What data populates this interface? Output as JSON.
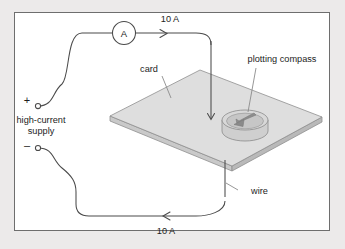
{
  "figure": {
    "kind": "physics-diagram",
    "background_color": "#eceaea",
    "panel_color": "#ffffff",
    "frame_color": "#6e6e6e",
    "wire_color": "#4a4a4a",
    "leader_color": "#8b8b8b",
    "card_top_color": "#dcdcdc",
    "card_edge_color": "#c2c2c2",
    "compass_color": "#d2d2d2",
    "needle_color": "#8a8a8a"
  },
  "cropped_caption": "",
  "labels": {
    "ammeter": "A",
    "current_top": "10 A",
    "current_bottom": "10 A",
    "plus_terminal": "+",
    "minus_terminal": "–",
    "supply_line1": "high-current",
    "supply_line2": "supply",
    "card": "card",
    "compass": "plotting compass",
    "wire": "wire"
  }
}
